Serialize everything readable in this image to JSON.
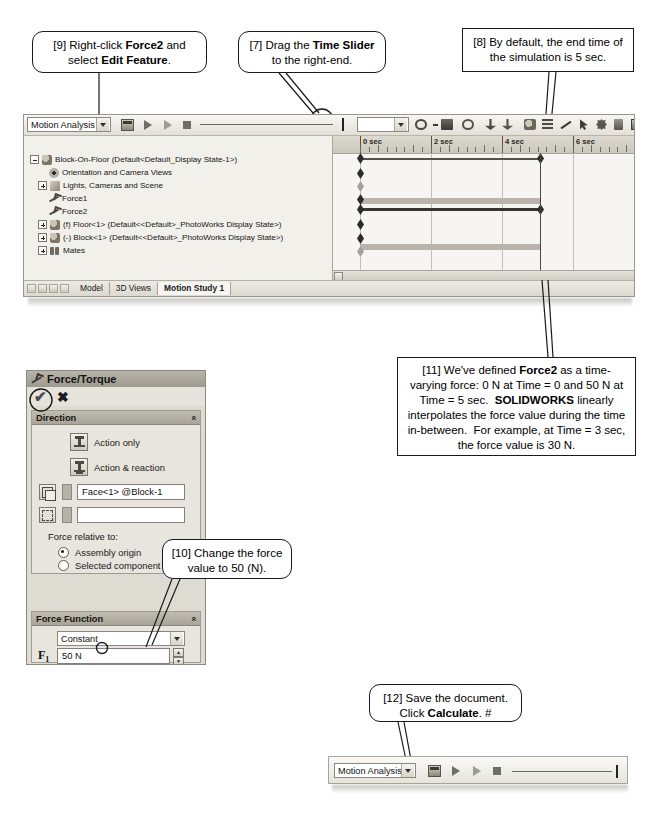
{
  "callouts": [
    {
      "id": "c9",
      "text_html": "[9] Right-click <b>Force2</b> and select <b>Edit Feature</b>."
    },
    {
      "id": "c7",
      "text_html": "[7] Drag the <b>Time Slider</b> to the right-end."
    },
    {
      "id": "c8",
      "text_html": "[8] By default, the end time of the simulation is 5 sec."
    },
    {
      "id": "c11",
      "text_html": "[11] We've defined <b>Force2</b> as a time-varying force: 0 N at Time = 0 and 50 N at Time = 5 sec.&nbsp; <b>SOLIDWORKS</b> linearly interpolates the force value during the time in-between.&nbsp; For example, at Time = 3 sec, the force value is 30 N."
    },
    {
      "id": "c10",
      "text_html": "[10] Change the force value to 50 (N)."
    },
    {
      "id": "c12",
      "text_html": "[12] Save the document. Click <b>Calculate</b>.&nbsp;#"
    }
  ],
  "motion_window": {
    "study_type": "Motion Analysis",
    "toolbar_icons": [
      "calculate-icon",
      "play-from-start-icon",
      "play-icon",
      "stop-icon"
    ],
    "filter_icons": [
      "filter-icon",
      "filter-animation-icon",
      "filter-drivers-icon",
      "filter-selected-icon",
      "filter-results-icon"
    ],
    "right_toolbar_icons": [
      "motor-dropdown-icon",
      "spring-icon",
      "damper-icon",
      "force-icon",
      "contact-icon",
      "gravity-icon",
      "results-icon",
      "plot-icon",
      "measure-icon",
      "pointer-icon",
      "gear-icon",
      "trash-icon",
      "export-icon"
    ],
    "tree": [
      {
        "indent": 0,
        "expander": "minus",
        "icon": "assembly-icon",
        "label": "Block-On-Floor  (Default<Default_Display State-1>)"
      },
      {
        "indent": 1,
        "expander": "none",
        "icon": "eye-icon",
        "label": "Orientation and Camera Views"
      },
      {
        "indent": 1,
        "expander": "plus",
        "icon": "light-icon",
        "label": "Lights, Cameras and Scene"
      },
      {
        "indent": 1,
        "expander": "none",
        "icon": "force-icon",
        "label": "Force1"
      },
      {
        "indent": 1,
        "expander": "none",
        "icon": "force-icon",
        "label": "Force2"
      },
      {
        "indent": 0,
        "expander": "plus",
        "icon": "part-icon",
        "label": "(f) Floor<1> (Default<<Default>_PhotoWorks Display State>)"
      },
      {
        "indent": 0,
        "expander": "plus",
        "icon": "part-icon",
        "label": "(-) Block<1> (Default<<Default>_PhotoWorks Display State>)"
      },
      {
        "indent": 0,
        "expander": "plus",
        "icon": "mate-icon",
        "label": "Mates"
      }
    ],
    "timeline": {
      "tick_labels": [
        "0 sec",
        "2 sec",
        "4 sec",
        "6 sec"
      ],
      "tick_seconds": [
        0,
        2,
        4,
        6
      ],
      "end_time_sec": 5,
      "playhead_sec": 5,
      "keyframe_rows_sec": [
        0,
        0,
        0,
        0,
        0,
        0,
        0
      ],
      "end_keys_sec": [
        5,
        5
      ]
    },
    "tabs": [
      "Model",
      "3D Views",
      "Motion Study 1"
    ],
    "active_tab": "Motion Study 1"
  },
  "force_panel": {
    "title": "Force/Torque",
    "accept_label": "✔",
    "cancel_label": "✖",
    "groups": [
      {
        "name": "Direction",
        "collapse_glyph": "«",
        "options": [
          {
            "label": "Action only",
            "icon": "action-only-icon"
          },
          {
            "label": "Action & reaction",
            "icon": "action-reaction-icon"
          }
        ],
        "fields": [
          {
            "icon": "face-select-icon",
            "value": "Face<1> @Block-1"
          },
          {
            "icon": "direction-select-icon",
            "value": ""
          }
        ],
        "relative_label": "Force relative to:",
        "radios": [
          {
            "label": "Assembly origin",
            "selected": true
          },
          {
            "label": "Selected component",
            "selected": false
          }
        ]
      },
      {
        "name": "Force Function",
        "collapse_glyph": "«",
        "function_type": "Constant",
        "value_label": "F",
        "value_sub": "1",
        "value": "50 N"
      }
    ]
  },
  "bottom_toolbar": {
    "study_type": "Motion Analysis",
    "icons": [
      "calculate-icon",
      "play-from-start-icon",
      "play-icon",
      "stop-icon"
    ],
    "slider_position_pct": 100
  }
}
